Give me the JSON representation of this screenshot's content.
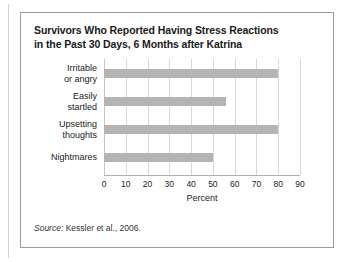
{
  "figure": {
    "title_line1": "Survivors Who Reported Having Stress Reactions",
    "title_line2": "in the Past 30 Days, 6 Months after Katrina",
    "source_prefix": "Source:",
    "source_text": "Kessler et al., 2006."
  },
  "chart_data": {
    "type": "bar",
    "orientation": "horizontal",
    "title": "Survivors Who Reported Having Stress Reactions in the Past 30 Days, 6 Months after Katrina",
    "categories": [
      "Irritable or angry",
      "Easily startled",
      "Upsetting thoughts",
      "Nightmares"
    ],
    "category_lines": [
      [
        "Irritable",
        "or angry"
      ],
      [
        "Easily",
        "startled"
      ],
      [
        "Upsetting",
        "thoughts"
      ],
      [
        "Nightmares"
      ]
    ],
    "values": [
      80,
      56,
      80,
      50
    ],
    "xlabel": "Percent",
    "ylabel": "",
    "xlim": [
      0,
      90
    ],
    "xticks": [
      0,
      10,
      20,
      30,
      40,
      50,
      60,
      70,
      80,
      90
    ],
    "xtick_labels": [
      "0",
      "10",
      "20",
      "30",
      "40",
      "50",
      "60",
      "70",
      "80",
      "90"
    ],
    "grid": true,
    "grid_axis": "x",
    "legend": false,
    "bar_color": "#b4b4b4",
    "gridline_color": "#d8d8d8"
  }
}
